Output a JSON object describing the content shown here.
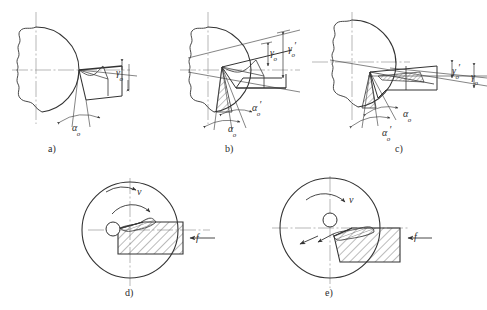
{
  "figure": {
    "background_color": "#ffffff",
    "line_color": "#333333",
    "centerline_color": "#999999",
    "hatch_color": "#555555"
  },
  "panels": [
    {
      "id": "a",
      "caption": "a)",
      "labels": [
        {
          "symbol": "γ",
          "sub": "o",
          "prime": "",
          "name": "rake-angle-gamma-o"
        },
        {
          "symbol": "α",
          "sub": "o",
          "prime": "",
          "name": "clearance-angle-alpha-o"
        }
      ]
    },
    {
      "id": "b",
      "caption": "b)",
      "labels": [
        {
          "symbol": "γ",
          "sub": "o",
          "prime": "",
          "name": "rake-angle-gamma-o"
        },
        {
          "symbol": "γ",
          "sub": "o",
          "prime": "′",
          "name": "rake-angle-gamma-o-prime"
        },
        {
          "symbol": "α",
          "sub": "o",
          "prime": "′",
          "name": "clearance-angle-alpha-o-prime"
        },
        {
          "symbol": "α",
          "sub": "o",
          "prime": "",
          "name": "clearance-angle-alpha-o"
        }
      ]
    },
    {
      "id": "c",
      "caption": "c)",
      "labels": [
        {
          "symbol": "γ",
          "sub": "o",
          "prime": "′",
          "name": "rake-angle-gamma-o-prime"
        },
        {
          "symbol": "γ",
          "sub": "o",
          "prime": "",
          "name": "rake-angle-gamma-o"
        },
        {
          "symbol": "α",
          "sub": "o",
          "prime": "",
          "name": "clearance-angle-alpha-o"
        },
        {
          "symbol": "α",
          "sub": "o",
          "prime": "′",
          "name": "clearance-angle-alpha-o-prime"
        }
      ]
    },
    {
      "id": "d",
      "caption": "d)",
      "labels": [
        {
          "symbol": "v",
          "sub": "",
          "prime": "",
          "name": "cutting-speed-v"
        },
        {
          "symbol": "f",
          "sub": "",
          "prime": "",
          "name": "feed-f"
        }
      ]
    },
    {
      "id": "e",
      "caption": "e)",
      "labels": [
        {
          "symbol": "v",
          "sub": "",
          "prime": "",
          "name": "cutting-speed-v"
        },
        {
          "symbol": "f",
          "sub": "",
          "prime": "",
          "name": "feed-f"
        }
      ]
    }
  ],
  "text": {
    "caption_a": "a)",
    "caption_b": "b)",
    "caption_c": "c)",
    "caption_d": "d)",
    "caption_e": "e)",
    "gamma_o": "γ",
    "gamma_sub": "o",
    "alpha_o": "α",
    "alpha_sub": "o",
    "prime": "′",
    "v": "v",
    "f": "f"
  }
}
